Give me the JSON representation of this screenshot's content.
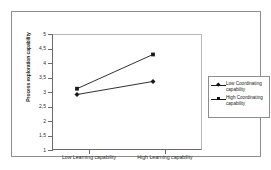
{
  "chart_data": {
    "type": "line",
    "title": "",
    "xlabel": "",
    "ylabel": "Process exploration capability",
    "categories": [
      "Low Learning capability",
      "High Learning capability"
    ],
    "ylim": [
      1,
      5
    ],
    "ytick_labels": [
      "5",
      "4,5",
      "4",
      "3,5",
      "3",
      "2,5",
      "2",
      "1,5",
      "1"
    ],
    "ytick_values": [
      5,
      4.5,
      4,
      3.5,
      3,
      2.5,
      2,
      1.5,
      1
    ],
    "grid": false,
    "legend_position": "right",
    "series": [
      {
        "name": "Low Coordinating capability",
        "marker": "diamond",
        "values": [
          2.5,
          2.95
        ]
      },
      {
        "name": "High Coordinating capability",
        "marker": "square",
        "values": [
          2.7,
          3.88
        ]
      }
    ]
  },
  "axes": {
    "y_title": "Process exploration capability",
    "ticks": [
      {
        "label": "5",
        "value": 5
      },
      {
        "label": "4,5",
        "value": 4.5
      },
      {
        "label": "4",
        "value": 4
      },
      {
        "label": "3,5",
        "value": 3.5
      },
      {
        "label": "3",
        "value": 3
      },
      {
        "label": "2,5",
        "value": 2.5
      },
      {
        "label": "2",
        "value": 2
      },
      {
        "label": "1,5",
        "value": 1.5
      },
      {
        "label": "1",
        "value": 1
      }
    ],
    "x_labels": [
      "Low Learning capability",
      "High Learning capability"
    ]
  },
  "legend": {
    "items": [
      {
        "label": "Low Coordinating capability",
        "marker": "diamond",
        "color": "#111111"
      },
      {
        "label": "High Coordinating capability",
        "marker": "square",
        "color": "#111111"
      }
    ]
  },
  "colors": {
    "line": "#1a1a1a",
    "frame": "#8d8d8d",
    "axis": "#6b6b6b",
    "background": "#ffffff"
  }
}
